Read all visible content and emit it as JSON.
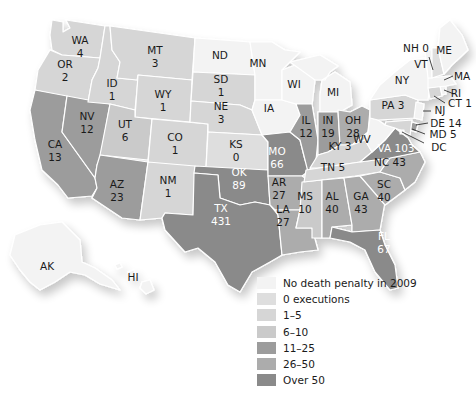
{
  "colors": {
    "no_dp": "#f3f3f3",
    "zero": "#dedede",
    "r1_5": "#d6d6d6",
    "r6_10": "#cacaca",
    "r11_25": "#9c9c9c",
    "r26_50": "#acacac",
    "over50": "#8a8a8a",
    "border": "#ffffff",
    "text": "#1a1a1a"
  },
  "legend": [
    {
      "label": "No death penalty in 2009",
      "color": "#f3f3f3"
    },
    {
      "label": "0 executions",
      "color": "#dedede"
    },
    {
      "label": "1–5",
      "color": "#d6d6d6"
    },
    {
      "label": "6–10",
      "color": "#cacaca"
    },
    {
      "label": "11–25",
      "color": "#9c9c9c"
    },
    {
      "label": "26–50",
      "color": "#acacac"
    },
    {
      "label": "Over 50",
      "color": "#8a8a8a"
    }
  ],
  "states": {
    "WA": {
      "abbr": "WA",
      "value": "4",
      "category": "1–5"
    },
    "OR": {
      "abbr": "OR",
      "value": "2",
      "category": "1–5"
    },
    "CA": {
      "abbr": "CA",
      "value": "13",
      "category": "11–25"
    },
    "ID": {
      "abbr": "ID",
      "value": "1",
      "category": "1–5"
    },
    "NV": {
      "abbr": "NV",
      "value": "12",
      "category": "11–25"
    },
    "MT": {
      "abbr": "MT",
      "value": "3",
      "category": "1–5"
    },
    "WY": {
      "abbr": "WY",
      "value": "1",
      "category": "1–5"
    },
    "UT": {
      "abbr": "UT",
      "value": "6",
      "category": "6–10"
    },
    "AZ": {
      "abbr": "AZ",
      "value": "23",
      "category": "11–25"
    },
    "CO": {
      "abbr": "CO",
      "value": "1",
      "category": "1–5"
    },
    "NM": {
      "abbr": "NM",
      "value": "1",
      "category": "1–5"
    },
    "ND": {
      "abbr": "ND",
      "value": "",
      "category": "No death penalty in 2009"
    },
    "SD": {
      "abbr": "SD",
      "value": "1",
      "category": "1–5"
    },
    "NE": {
      "abbr": "NE",
      "value": "3",
      "category": "1–5"
    },
    "KS": {
      "abbr": "KS",
      "value": "0",
      "category": "0 executions"
    },
    "OK": {
      "abbr": "OK",
      "value": "89",
      "category": "Over 50"
    },
    "TX": {
      "abbr": "TX",
      "value": "431",
      "category": "Over 50"
    },
    "MN": {
      "abbr": "MN",
      "value": "",
      "category": "No death penalty in 2009"
    },
    "IA": {
      "abbr": "IA",
      "value": "",
      "category": "No death penalty in 2009"
    },
    "MO": {
      "abbr": "MO",
      "value": "66",
      "category": "Over 50"
    },
    "AR": {
      "abbr": "AR",
      "value": "27",
      "category": "26–50"
    },
    "LA": {
      "abbr": "LA",
      "value": "27",
      "category": "26–50"
    },
    "WI": {
      "abbr": "WI",
      "value": "",
      "category": "No death penalty in 2009"
    },
    "IL": {
      "abbr": "IL",
      "value": "12",
      "category": "11–25"
    },
    "MI": {
      "abbr": "MI",
      "value": "",
      "category": "No death penalty in 2009"
    },
    "IN": {
      "abbr": "IN",
      "value": "19",
      "category": "11–25"
    },
    "OH": {
      "abbr": "OH",
      "value": "28",
      "category": "26–50"
    },
    "KY": {
      "abbr": "KY",
      "value": "3",
      "category": "1–5"
    },
    "TN": {
      "abbr": "TN",
      "value": "5",
      "category": "1–5"
    },
    "MS": {
      "abbr": "MS",
      "value": "10",
      "category": "6–10"
    },
    "AL": {
      "abbr": "AL",
      "value": "40",
      "category": "26–50"
    },
    "GA": {
      "abbr": "GA",
      "value": "43",
      "category": "26–50"
    },
    "FL": {
      "abbr": "FL",
      "value": "67",
      "category": "Over 50"
    },
    "SC": {
      "abbr": "SC",
      "value": "40",
      "category": "26–50"
    },
    "NC": {
      "abbr": "NC",
      "value": "43",
      "category": "26–50"
    },
    "VA": {
      "abbr": "VA",
      "value": "103",
      "category": "Over 50"
    },
    "WV": {
      "abbr": "WV",
      "value": "",
      "category": "No death penalty in 2009"
    },
    "PA": {
      "abbr": "PA",
      "value": "3",
      "category": "1–5"
    },
    "NY": {
      "abbr": "NY",
      "value": "",
      "category": "No death penalty in 2009"
    },
    "VT": {
      "abbr": "VT",
      "value": "",
      "category": "No death penalty in 2009"
    },
    "NH": {
      "abbr": "NH",
      "value": "0",
      "category": "0 executions"
    },
    "ME": {
      "abbr": "ME",
      "value": "",
      "category": "No death penalty in 2009"
    },
    "MA": {
      "abbr": "MA",
      "value": "",
      "category": "No death penalty in 2009"
    },
    "RI": {
      "abbr": "RI",
      "value": "",
      "category": "No death penalty in 2009"
    },
    "CT": {
      "abbr": "CT",
      "value": "1",
      "category": "1–5"
    },
    "NJ": {
      "abbr": "NJ",
      "value": "",
      "category": "No death penalty in 2009"
    },
    "DE": {
      "abbr": "DE",
      "value": "14",
      "category": "11–25"
    },
    "MD": {
      "abbr": "MD",
      "value": "5",
      "category": "1–5"
    },
    "DC": {
      "abbr": "DC",
      "value": "",
      "category": "No death penalty in 2009"
    },
    "AK": {
      "abbr": "AK",
      "value": "",
      "category": "No death penalty in 2009"
    },
    "HI": {
      "abbr": "HI",
      "value": "",
      "category": "No death penalty in 2009"
    }
  },
  "labels": {
    "WA": [
      "WA",
      "4"
    ],
    "OR": [
      "OR",
      "2"
    ],
    "CA": [
      "CA",
      "13"
    ],
    "ID": [
      "ID",
      "1"
    ],
    "NV": [
      "NV",
      "12"
    ],
    "MT": [
      "MT",
      "3"
    ],
    "WY": [
      "WY",
      "1"
    ],
    "UT": [
      "UT",
      "6"
    ],
    "AZ": [
      "AZ",
      "23"
    ],
    "CO": [
      "CO",
      "1"
    ],
    "NM": [
      "NM",
      "1"
    ],
    "ND": [
      "ND"
    ],
    "SD": [
      "SD",
      "1"
    ],
    "NE": [
      "NE",
      "3"
    ],
    "KS": [
      "KS",
      "0"
    ],
    "OK": [
      "OK",
      "89"
    ],
    "TX": [
      "TX",
      "431"
    ],
    "MN": [
      "MN"
    ],
    "IA": [
      "IA"
    ],
    "MO": [
      "MO",
      "66"
    ],
    "AR": [
      "AR",
      "27"
    ],
    "LA": [
      "LA",
      "27"
    ],
    "WI": [
      "WI"
    ],
    "IL": [
      "IL",
      "12"
    ],
    "MI": [
      "MI"
    ],
    "IN": [
      "IN",
      "19"
    ],
    "OH": [
      "OH",
      "28"
    ],
    "KY": [
      "KY 3"
    ],
    "TN": [
      "TN 5"
    ],
    "MS": [
      "MS",
      "10"
    ],
    "AL": [
      "AL",
      "40"
    ],
    "GA": [
      "GA",
      "43"
    ],
    "FL": [
      "FL",
      "67"
    ],
    "SC": [
      "SC",
      "40"
    ],
    "NC": [
      "NC 43"
    ],
    "VA": [
      "VA 103"
    ],
    "WV": [
      "WV"
    ],
    "PA": [
      "PA  3"
    ],
    "NY": [
      "NY"
    ],
    "VT": [
      "VT"
    ],
    "NH": [
      "NH 0"
    ],
    "ME": [
      "ME"
    ],
    "MA": [
      "MA"
    ],
    "RI": [
      "RI"
    ],
    "CT": [
      "CT 1"
    ],
    "NJ": [
      "NJ"
    ],
    "DE": [
      "DE 14"
    ],
    "MD": [
      "MD 5"
    ],
    "DC": [
      "DC"
    ],
    "AK": [
      "AK"
    ],
    "HI": [
      "HI"
    ]
  },
  "chart_data": {
    "type": "choropleth",
    "title": "",
    "legend": [
      "No death penalty in 2009",
      "0 executions",
      "1–5",
      "6–10",
      "11–25",
      "26–50",
      "Over 50"
    ],
    "categories": [
      "WA",
      "OR",
      "CA",
      "ID",
      "NV",
      "MT",
      "WY",
      "UT",
      "AZ",
      "CO",
      "NM",
      "SD",
      "NE",
      "KS",
      "OK",
      "TX",
      "MO",
      "AR",
      "LA",
      "IL",
      "IN",
      "OH",
      "KY",
      "TN",
      "MS",
      "AL",
      "GA",
      "FL",
      "SC",
      "NC",
      "VA",
      "PA",
      "NH",
      "CT",
      "DE",
      "MD"
    ],
    "values": [
      4,
      2,
      13,
      1,
      12,
      3,
      1,
      6,
      23,
      1,
      1,
      1,
      3,
      0,
      89,
      431,
      66,
      27,
      27,
      12,
      19,
      28,
      3,
      5,
      10,
      40,
      43,
      67,
      40,
      43,
      103,
      3,
      0,
      1,
      14,
      5
    ],
    "no_death_penalty_states": [
      "ND",
      "MN",
      "IA",
      "WI",
      "MI",
      "WV",
      "NY",
      "VT",
      "ME",
      "MA",
      "RI",
      "NJ",
      "DC",
      "AK",
      "HI"
    ]
  }
}
